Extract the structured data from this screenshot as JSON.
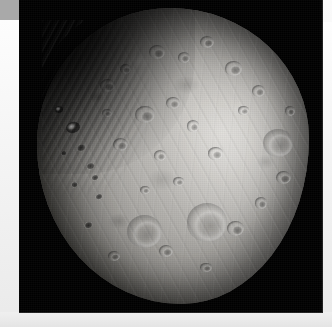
{
  "page": {
    "background_color": "#f2f2f2",
    "topbar_color": "#a9a9a9",
    "caption": ""
  },
  "photo": {
    "name": "phobos-image",
    "backdrop_color": "#000000",
    "subject": "Phobos",
    "body_tint": "#b3b1ad",
    "shadow_color": "#24231f",
    "highlight_color": "#d8d6d2",
    "alt": "Grayscale photograph of the Martian moon Phobos, heavily cratered and irregularly shaped, lit from the right against a black sky",
    "features": [
      {
        "name": "stickney-crater",
        "kind": "basin"
      },
      {
        "name": "grooves",
        "kind": "striation"
      },
      {
        "name": "terminator",
        "kind": "shadow"
      }
    ]
  },
  "craters": [
    {
      "name": "crater-limb-bright-1",
      "cls": "bright",
      "left": 10.5,
      "top": 38.5,
      "w": 5.0,
      "h": 3.6,
      "rot": -18
    },
    {
      "name": "crater-limb-bright-2",
      "cls": "bright",
      "left": 6.8,
      "top": 33.0,
      "w": 3.0,
      "h": 2.4,
      "rot": -10
    },
    {
      "name": "crater-limb-dark-1",
      "cls": "dark",
      "left": 14.0,
      "top": 45.5,
      "w": 4.2,
      "h": 3.0,
      "rot": -22
    },
    {
      "name": "crater-limb-dark-2",
      "cls": "dark",
      "left": 17.5,
      "top": 52.0,
      "w": 3.6,
      "h": 2.6,
      "rot": -22
    },
    {
      "name": "crater-limb-dark-3",
      "cls": "dark",
      "left": 12.0,
      "top": 58.5,
      "w": 3.0,
      "h": 2.2,
      "rot": -18
    },
    {
      "name": "crater-limb-dark-4",
      "cls": "dark",
      "left": 21.0,
      "top": 62.5,
      "w": 3.4,
      "h": 2.4,
      "rot": -24
    },
    {
      "name": "crater-limb-dark-5",
      "cls": "dark",
      "left": 8.5,
      "top": 48.0,
      "w": 2.6,
      "h": 2.0,
      "rot": -12
    },
    {
      "name": "crater-nw-1",
      "cls": "",
      "left": 23.0,
      "top": 24.0,
      "w": 5.5,
      "h": 4.4,
      "rot": 0
    },
    {
      "name": "crater-nw-2",
      "cls": "",
      "left": 30.5,
      "top": 19.0,
      "w": 4.2,
      "h": 3.4,
      "rot": 0
    },
    {
      "name": "crater-n-1",
      "cls": "",
      "left": 41.0,
      "top": 12.5,
      "w": 6.0,
      "h": 4.6,
      "rot": 0
    },
    {
      "name": "crater-n-2",
      "cls": "",
      "left": 52.0,
      "top": 15.0,
      "w": 4.4,
      "h": 3.6,
      "rot": 0
    },
    {
      "name": "crater-n-3",
      "cls": "",
      "left": 60.0,
      "top": 9.5,
      "w": 5.0,
      "h": 4.0,
      "rot": 0
    },
    {
      "name": "crater-ne-1",
      "cls": "",
      "left": 69.0,
      "top": 18.0,
      "w": 6.5,
      "h": 5.0,
      "rot": 0
    },
    {
      "name": "crater-ne-2",
      "cls": "",
      "left": 79.0,
      "top": 26.0,
      "w": 5.0,
      "h": 4.2,
      "rot": 0
    },
    {
      "name": "crater-c-1",
      "cls": "",
      "left": 36.0,
      "top": 33.0,
      "w": 7.5,
      "h": 6.0,
      "rot": 0
    },
    {
      "name": "crater-c-2",
      "cls": "",
      "left": 47.5,
      "top": 30.0,
      "w": 5.0,
      "h": 4.2,
      "rot": 0
    },
    {
      "name": "crater-c-3",
      "cls": "",
      "left": 55.0,
      "top": 38.0,
      "w": 4.6,
      "h": 3.8,
      "rot": 0
    },
    {
      "name": "crater-c-4",
      "cls": "",
      "left": 28.0,
      "top": 44.0,
      "w": 5.6,
      "h": 4.4,
      "rot": 0
    },
    {
      "name": "crater-c-5",
      "cls": "",
      "left": 43.0,
      "top": 48.0,
      "w": 4.4,
      "h": 3.6,
      "rot": 0
    },
    {
      "name": "crater-c-6",
      "cls": "",
      "left": 63.0,
      "top": 47.0,
      "w": 5.2,
      "h": 4.2,
      "rot": 0
    },
    {
      "name": "crater-e-1",
      "cls": "basin",
      "left": 83.0,
      "top": 41.0,
      "w": 11.0,
      "h": 9.5,
      "rot": 0
    },
    {
      "name": "crater-e-2",
      "cls": "",
      "left": 88.0,
      "top": 55.0,
      "w": 5.5,
      "h": 4.6,
      "rot": 0
    },
    {
      "name": "crater-se-1",
      "cls": "basin",
      "left": 55.0,
      "top": 66.0,
      "w": 15.0,
      "h": 13.0,
      "rot": 0
    },
    {
      "name": "crater-se-2",
      "cls": "",
      "left": 70.0,
      "top": 72.0,
      "w": 6.0,
      "h": 5.0,
      "rot": 0
    },
    {
      "name": "crater-s-1",
      "cls": "basin",
      "left": 33.0,
      "top": 70.0,
      "w": 13.0,
      "h": 11.0,
      "rot": 0
    },
    {
      "name": "crater-s-2",
      "cls": "",
      "left": 45.0,
      "top": 80.0,
      "w": 5.0,
      "h": 4.0,
      "rot": 0
    },
    {
      "name": "crater-s-3",
      "cls": "",
      "left": 26.0,
      "top": 82.0,
      "w": 4.4,
      "h": 3.4,
      "rot": 0
    },
    {
      "name": "crater-sw-1",
      "cls": "dark",
      "left": 17.0,
      "top": 72.0,
      "w": 3.6,
      "h": 2.8,
      "rot": -20
    },
    {
      "name": "crater-w-1",
      "cls": "dark",
      "left": 19.5,
      "top": 56.0,
      "w": 3.2,
      "h": 2.4,
      "rot": -20
    },
    {
      "name": "crater-w-2",
      "cls": "",
      "left": 24.0,
      "top": 34.0,
      "w": 3.4,
      "h": 2.8,
      "rot": 0
    },
    {
      "name": "crater-ne-3",
      "cls": "",
      "left": 74.0,
      "top": 33.0,
      "w": 3.8,
      "h": 3.2,
      "rot": 0
    },
    {
      "name": "crater-e-3",
      "cls": "",
      "left": 91.0,
      "top": 33.0,
      "w": 4.0,
      "h": 3.4,
      "rot": 0
    },
    {
      "name": "crater-se-3",
      "cls": "",
      "left": 80.0,
      "top": 64.0,
      "w": 4.6,
      "h": 3.8,
      "rot": 0
    },
    {
      "name": "crater-s-4",
      "cls": "",
      "left": 60.0,
      "top": 86.0,
      "w": 4.2,
      "h": 3.2,
      "rot": 0
    },
    {
      "name": "crater-c-7",
      "cls": "",
      "left": 50.0,
      "top": 57.0,
      "w": 4.0,
      "h": 3.2,
      "rot": 0
    },
    {
      "name": "crater-c-8",
      "cls": "",
      "left": 38.0,
      "top": 60.0,
      "w": 3.6,
      "h": 3.0,
      "rot": 0
    }
  ]
}
